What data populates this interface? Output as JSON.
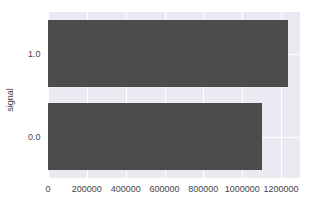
{
  "chart_data": {
    "type": "bar",
    "orientation": "horizontal",
    "title": "",
    "xlabel": "",
    "ylabel": "signal",
    "categories": [
      "1.0",
      "0.0"
    ],
    "values": [
      1237000,
      1103000
    ],
    "xlim": [
      0,
      1300000
    ],
    "xticks": [
      "0",
      "200000",
      "400000",
      "600000",
      "800000",
      "1000000",
      "1200000"
    ],
    "grid": true,
    "bar_color": "#4c4c4c",
    "background": "#eaeaf2"
  }
}
